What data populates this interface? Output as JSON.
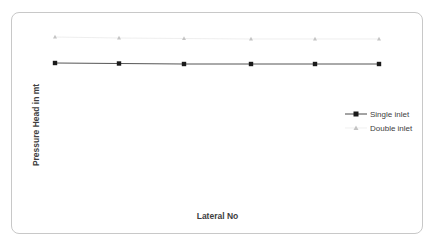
{
  "chart_data": {
    "type": "line",
    "title": "",
    "xlabel": "Lateral No",
    "ylabel": "Pressure Head in mt",
    "x": [
      1,
      2,
      3,
      4,
      5,
      6
    ],
    "grid": false,
    "legend_position": "right",
    "series": [
      {
        "name": "Single inlet",
        "color": "#1a1a1a",
        "marker": "square",
        "values": [
          63.5,
          63.8,
          64.2,
          64.2,
          64.2,
          64.3
        ],
        "pixel_y": [
          63,
          63.5,
          64,
          64,
          64,
          64
        ]
      },
      {
        "name": "Double inlet",
        "color": "#b4b4b4",
        "marker": "triangle",
        "values": [
          37.5,
          38,
          38.5,
          38.7,
          38.7,
          38.7
        ],
        "pixel_y": [
          37,
          38,
          38.5,
          39,
          39,
          39
        ]
      }
    ],
    "pixel_x": [
      55,
      119,
      184,
      251,
      315,
      379
    ]
  },
  "legend": {
    "items": [
      {
        "label": "Single inlet"
      },
      {
        "label": "Double inlet"
      }
    ]
  }
}
